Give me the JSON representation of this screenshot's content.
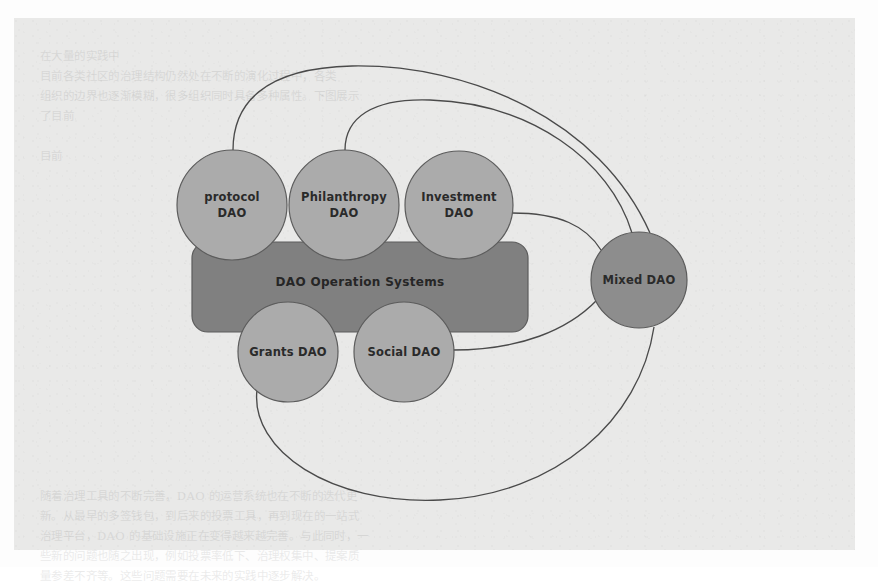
{
  "figure": {
    "title": "DAO Operation Systems",
    "background_color": "#e9e9e8",
    "page_color": "#fdfdfd"
  },
  "palette": {
    "node_light": "#ababab",
    "node_dark": "#8d8d8d",
    "group_box": "#808080",
    "edge_stroke": "#4a4a4a",
    "node_stroke": "#5c5c5c",
    "label_color": "#2a2a2a"
  },
  "group_box": {
    "label": "DAO Operation Systems",
    "x": 192,
    "y": 242,
    "width": 336,
    "height": 90,
    "radius": 16,
    "fill": "#808080",
    "label_x": 360,
    "label_y": 286
  },
  "nodes": [
    {
      "id": "protocol-dao",
      "lines": [
        "protocol",
        "DAO"
      ],
      "cx": 232,
      "cy": 205,
      "r": 55,
      "fill": "#ababab"
    },
    {
      "id": "philanthropy-dao",
      "lines": [
        "Philanthropy",
        "DAO"
      ],
      "cx": 344,
      "cy": 205,
      "r": 55,
      "fill": "#ababab"
    },
    {
      "id": "investment-dao",
      "lines": [
        "Investment",
        "DAO"
      ],
      "cx": 459,
      "cy": 205,
      "r": 54,
      "fill": "#ababab"
    },
    {
      "id": "grants-dao",
      "lines": [
        "Grants DAO"
      ],
      "cx": 288,
      "cy": 352,
      "r": 50,
      "fill": "#ababab"
    },
    {
      "id": "social-dao",
      "lines": [
        "Social DAO"
      ],
      "cx": 404,
      "cy": 352,
      "r": 50,
      "fill": "#ababab"
    },
    {
      "id": "mixed-dao",
      "lines": [
        "Mixed DAO"
      ],
      "cx": 639,
      "cy": 280,
      "r": 48,
      "fill": "#8d8d8d"
    }
  ],
  "edges": [
    {
      "id": "edge-protocol-to-mixed",
      "from": "protocol-dao",
      "to": "mixed-dao",
      "path": "M 233 150 C 233 105, 262 68, 352 66 C 470 64, 600 120, 650 233"
    },
    {
      "id": "edge-philanthropy-to-mixed",
      "from": "philanthropy-dao",
      "to": "mixed-dao",
      "path": "M 345 150 C 345 118, 372 98, 430 100 C 530 103, 610 160, 632 233"
    },
    {
      "id": "edge-investment-to-mixed",
      "from": "investment-dao",
      "to": "mixed-dao",
      "path": "M 512 213 C 560 213, 586 226, 601 250"
    },
    {
      "id": "edge-social-to-mixed",
      "from": "social-dao",
      "to": "mixed-dao",
      "path": "M 453 350 C 520 350, 568 330, 597 300"
    },
    {
      "id": "edge-grants-to-mixed",
      "from": "grants-dao",
      "to": "mixed-dao",
      "path": "M 257 390 C 250 450, 330 505, 440 500 C 556 495, 640 420, 654 327"
    }
  ],
  "ghost_text": {
    "lines": [
      "",
      "                                                                      在大量的实践中",
      "                  目前各类社区的治理结构仍然处在不断的演化过程中，各类",
      "               组织的边界也逐渐模糊，很多组织同时具备多种属性。下图展示",
      "               了目前",
      "",
      "                                                                                  目前",
      "",
      "",
      "",
      "",
      "",
      "",
      "",
      "",
      "",
      "",
      "",
      "",
      "",
      "",
      "",
      "",
      "            随着治理工具的不断完善，DAO 的运营系统也在不断的迭代更",
      "         新。从最早的多签钱包，到后来的投票工具，再到现在的一站式",
      "         治理平台，DAO 的基础设施正在变得越来越完善。与此同时，一",
      "         些新的问题也随之出现，例如投票率低下、治理权集中、提案质",
      "         量参差不齐等。这些问题需要在未来的实践中逐步解决。"
    ]
  }
}
